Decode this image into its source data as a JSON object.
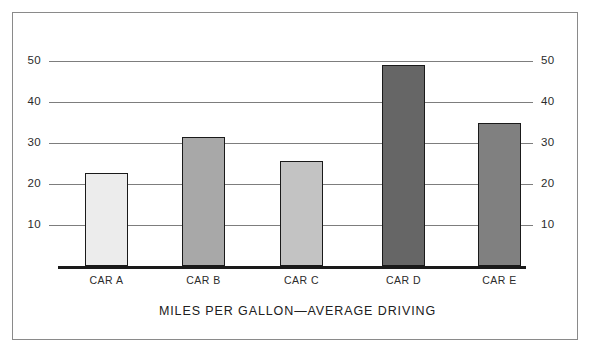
{
  "chart_data": {
    "type": "bar",
    "title": "MILES PER GALLON—AVERAGE DRIVING",
    "xlabel": "",
    "ylabel": "",
    "categories": [
      "CAR A",
      "CAR B",
      "CAR C",
      "CAR D",
      "CAR E"
    ],
    "values": [
      22.7,
      31.5,
      25.5,
      49.0,
      34.8
    ],
    "ylim": [
      0,
      52
    ],
    "yticks": [
      10,
      20,
      30,
      40,
      50
    ],
    "ytick_labels_left": [
      "50",
      "40",
      "30",
      "20",
      "10"
    ],
    "ytick_labels_right": [
      "50",
      "40",
      "30",
      "20",
      "10"
    ],
    "grid": true,
    "legend": "none",
    "dual_axis": true,
    "bar_colors": [
      "#ececec",
      "#a8a8a8",
      "#c3c3c3",
      "#666666",
      "#808080"
    ],
    "bar_edge_color": "#1a1a1a",
    "gridline_color": "#7d7d7d",
    "baseline_color": "#1a1a1a",
    "frame_color": "#8a8a8a",
    "background": "#ffffff"
  },
  "axis": {
    "ticks": [
      {
        "label": "50",
        "value": 50
      },
      {
        "label": "40",
        "value": 40
      },
      {
        "label": "30",
        "value": 30
      },
      {
        "label": "20",
        "value": 20
      },
      {
        "label": "10",
        "value": 10
      }
    ]
  }
}
